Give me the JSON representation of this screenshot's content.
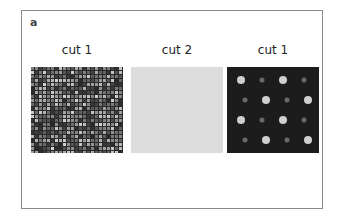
{
  "figure": {
    "panel_label": "a",
    "panels": [
      {
        "caption": "cut 1",
        "description": "textured grayscale scan with dense repeating dot pattern"
      },
      {
        "caption": "cut 2",
        "description": "uniform light gray field"
      },
      {
        "caption": "cut 1",
        "description": "dark field with bright lattice spots"
      }
    ]
  }
}
